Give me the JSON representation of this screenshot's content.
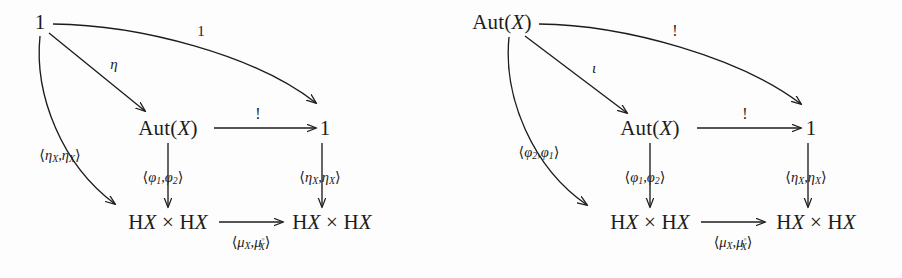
{
  "figure": {
    "kind": "commutative-diagram-pair",
    "background_color": "#fdfdfd",
    "ink_color": "#1c1c1c"
  },
  "diagrams": [
    {
      "id": "left",
      "nodes": {
        "top_left": "1",
        "middle": "Aut(X)",
        "top_right": "1",
        "bottom_left": "HX × HX",
        "bottom_right": "HX × HX"
      },
      "labels": {
        "curved_top": "1",
        "diag_to_middle": "η",
        "diag_to_bottom_left": "⟨ηX,ηX⟩",
        "middle_to_right": "!",
        "middle_vertical": "⟨φ1,φ2⟩",
        "right_vertical": "⟨ηX,ηX⟩",
        "bottom_horizontal": "⟨μX,μ°X⟩"
      }
    },
    {
      "id": "right",
      "nodes": {
        "top_left": "Aut(X)",
        "middle": "Aut(X)",
        "top_right": "1",
        "bottom_left": "HX × HX",
        "bottom_right": "HX × HX"
      },
      "labels": {
        "curved_top": "!",
        "diag_to_middle": "ι",
        "diag_to_bottom_left": "⟨φ2,φ1⟩",
        "middle_to_right": "!",
        "middle_vertical": "⟨φ1,φ2⟩",
        "right_vertical": "⟨ηX,ηX⟩",
        "bottom_horizontal": "⟨μX,μ°X⟩"
      }
    }
  ]
}
